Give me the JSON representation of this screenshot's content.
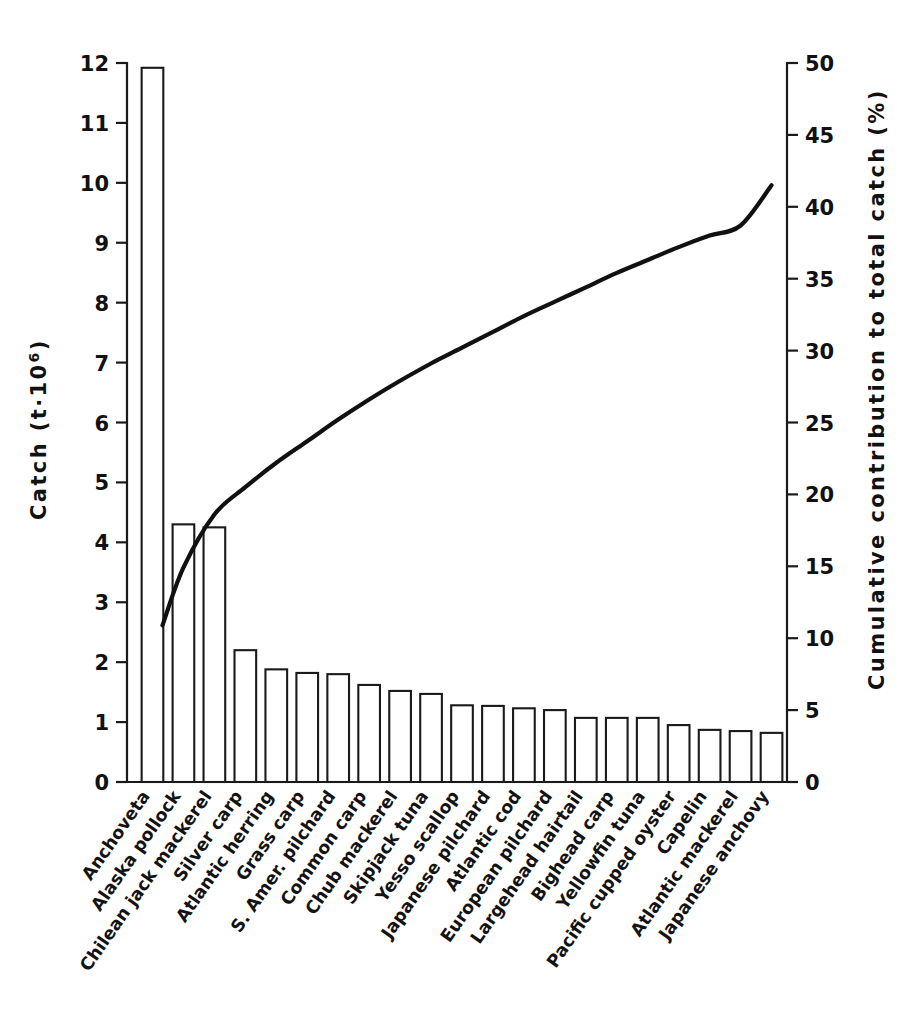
{
  "chart_data": {
    "type": "bar",
    "title": "",
    "xlabel": "",
    "ylabel": "Catch (t·10⁶)",
    "y2label": "Cumulative contribution to total catch (%)",
    "ylim": [
      0,
      12
    ],
    "y2lim": [
      0,
      50
    ],
    "grid": false,
    "legend": "none",
    "categories": [
      "Anchoveta",
      "Alaska pollock",
      "Chilean jack mackerel",
      "Silver carp",
      "Atlantic herring",
      "Grass carp",
      "S. Amer. pilchard",
      "Common carp",
      "Chub mackerel",
      "Skipjack tuna",
      "Yesso scallop",
      "Japanese pilchard",
      "Atlantic cod",
      "European pilchard",
      "Largehead hairtail",
      "Bighead carp",
      "Yellowfin tuna",
      "Pacific cupped oyster",
      "Capelin",
      "Atlantic mackerel",
      "Japanese anchovy"
    ],
    "series": [
      {
        "name": "Catch (t·10⁶)",
        "axis": "left",
        "render": "bar",
        "values": [
          11.92,
          4.3,
          4.25,
          2.2,
          1.88,
          1.82,
          1.8,
          1.62,
          1.52,
          1.47,
          1.28,
          1.27,
          1.23,
          1.2,
          1.07,
          1.07,
          1.07,
          0.95,
          0.87,
          0.85,
          0.82
        ]
      },
      {
        "name": "Cumulative contribution to total catch (%)",
        "axis": "right",
        "render": "line",
        "values": [
          10.9,
          14.9,
          18.6,
          20.5,
          22.2,
          23.7,
          25.2,
          26.6,
          27.9,
          29.1,
          30.2,
          31.3,
          32.4,
          33.4,
          34.4,
          35.4,
          36.3,
          37.2,
          38.0,
          38.7,
          41.5
        ]
      }
    ],
    "y_ticks": [
      0,
      1,
      2,
      3,
      4,
      5,
      6,
      7,
      8,
      9,
      10,
      11,
      12
    ],
    "y_ticklabels": [
      "0",
      "1",
      "2",
      "3",
      "4",
      "5",
      "6",
      "7",
      "8",
      "9",
      "10",
      "11",
      "12"
    ],
    "y2_ticks": [
      0,
      5,
      10,
      15,
      20,
      25,
      30,
      35,
      40,
      45,
      50
    ],
    "y2_ticklabels": [
      "0",
      "5",
      "10",
      "15",
      "20",
      "25",
      "30",
      "35",
      "40",
      "45",
      "50"
    ]
  },
  "axes": {
    "left_title_main": "Catch (t·10",
    "left_title_sup": "6",
    "left_title_close": ")",
    "right_title": "Cumulative contribution to total catch (%)"
  }
}
